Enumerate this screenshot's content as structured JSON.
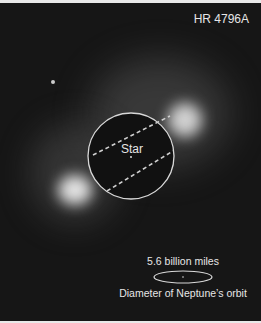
{
  "title": "HR 4796A",
  "star_label": "Star",
  "scale": {
    "distance": "5.6 billion miles",
    "caption": "Diameter of Neptune’s orbit"
  },
  "colors": {
    "background": "#161616",
    "annotation": "#e6e6e6"
  }
}
